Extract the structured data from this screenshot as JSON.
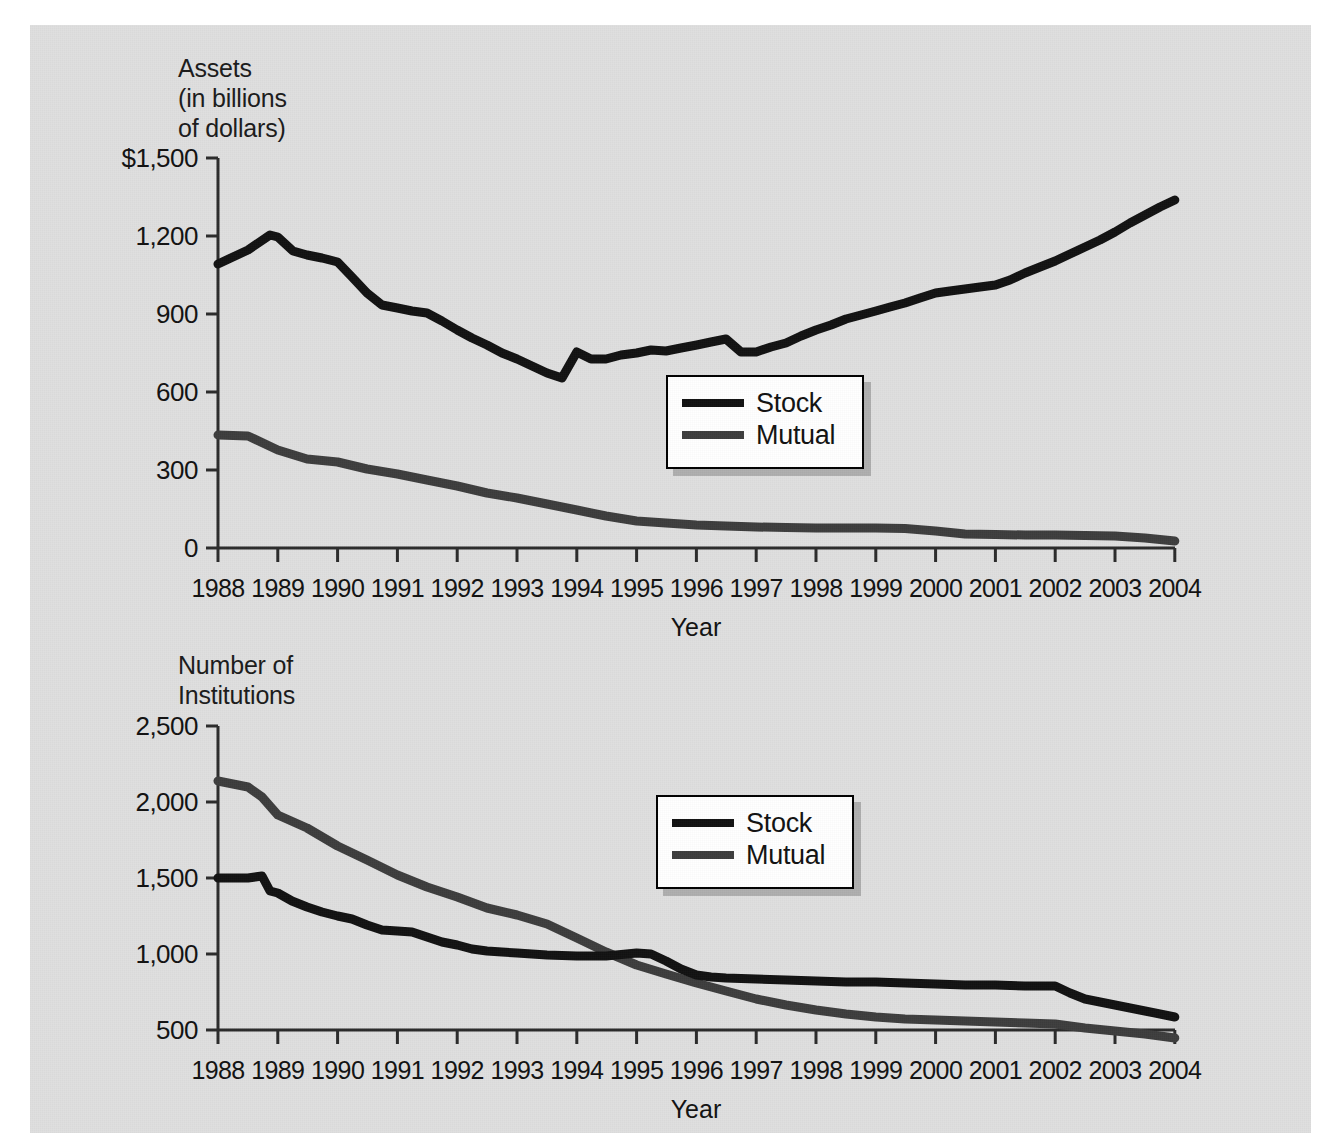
{
  "figure": {
    "background_color": "#dfdfdf",
    "stock_color": "#111111",
    "mutual_color": "#3d3d3d"
  },
  "charts": [
    {
      "id": "assets-chart",
      "axis_title": "Assets\n(in billions\nof dollars)",
      "xlabel": "Year",
      "yticks": [
        "$1,500",
        "1,200",
        "900",
        "600",
        "300",
        "0"
      ],
      "xticks": [
        "1988",
        "1989",
        "1990",
        "1991",
        "1992",
        "1993",
        "1994",
        "1995",
        "1996",
        "1997",
        "1998",
        "1999",
        "2000",
        "2001",
        "2002",
        "2003",
        "2004"
      ],
      "legend": [
        {
          "label": "Stock",
          "color": "#111111"
        },
        {
          "label": "Mutual",
          "color": "#3d3d3d"
        }
      ]
    },
    {
      "id": "institutions-chart",
      "axis_title": "Number of\nInstitutions",
      "xlabel": "Year",
      "yticks": [
        "2,500",
        "2,000",
        "1,500",
        "1,000",
        "500"
      ],
      "xticks": [
        "1988",
        "1989",
        "1990",
        "1991",
        "1992",
        "1993",
        "1994",
        "1995",
        "1996",
        "1997",
        "1998",
        "1999",
        "2000",
        "2001",
        "2002",
        "2003",
        "2004"
      ],
      "legend": [
        {
          "label": "Stock",
          "color": "#111111"
        },
        {
          "label": "Mutual",
          "color": "#3d3d3d"
        }
      ]
    }
  ],
  "chart_data": [
    {
      "type": "line",
      "title": "Assets (in billions of dollars)",
      "xlabel": "Year",
      "ylabel": "Assets (in billions of dollars)",
      "x": [
        1988,
        1989,
        1990,
        1991,
        1992,
        1993,
        1994,
        1995,
        1996,
        1997,
        1998,
        1999,
        2000,
        2001,
        2002,
        2003,
        2004
      ],
      "xlim": [
        1988,
        2004
      ],
      "ylim": [
        0,
        1500
      ],
      "yticks": [
        0,
        300,
        600,
        900,
        1200,
        1500
      ],
      "grid": false,
      "legend_position": "center",
      "series": [
        {
          "name": "Stock",
          "color": "#111111",
          "values": [
            1095,
            1155,
            945,
            905,
            830,
            760,
            800,
            850,
            870,
            855,
            905,
            990,
            1060,
            1075,
            1150,
            1265,
            1405
          ],
          "note": "peaks at about 1,205 in mid-1988 and dips to about 755 in late 1992"
        },
        {
          "name": "Mutual",
          "color": "#3d3d3d",
          "values": [
            435,
            375,
            330,
            285,
            240,
            195,
            160,
            152,
            148,
            142,
            145,
            150,
            128,
            126,
            125,
            118,
            105
          ],
          "note": "declines steadily then flattens after 1994"
        }
      ]
    },
    {
      "type": "line",
      "title": "Number of Institutions",
      "xlabel": "Year",
      "ylabel": "Number of Institutions",
      "x": [
        1988,
        1989,
        1990,
        1991,
        1992,
        1993,
        1994,
        1995,
        1996,
        1997,
        1998,
        1999,
        2000,
        2001,
        2002,
        2003,
        2004
      ],
      "xlim": [
        1988,
        2004
      ],
      "ylim": [
        500,
        2500
      ],
      "yticks": [
        500,
        1000,
        1500,
        2000,
        2500
      ],
      "grid": false,
      "legend_position": "upper-center",
      "series": [
        {
          "name": "Stock",
          "color": "#111111",
          "values": [
            1480,
            1415,
            1265,
            1100,
            1075,
            1045,
            1040,
            1035,
            1025,
            905,
            890,
            885,
            875,
            850,
            855,
            775,
            705
          ],
          "note": "small bump to about 1,490 in late 1988 before declining"
        },
        {
          "name": "Mutual",
          "color": "#3d3d3d",
          "values": [
            2140,
            1890,
            1680,
            1490,
            1370,
            1265,
            1095,
            955,
            860,
            800,
            760,
            725,
            715,
            705,
            700,
            655,
            615
          ],
          "note": "crosses below the Stock line near 1994-1995"
        }
      ]
    }
  ]
}
